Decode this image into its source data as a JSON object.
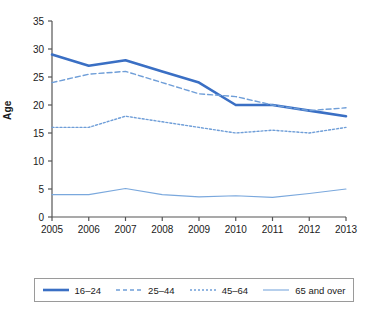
{
  "chart_data": {
    "type": "line",
    "title": "",
    "xlabel": "",
    "ylabel": "Age",
    "x": [
      2005,
      2006,
      2007,
      2008,
      2009,
      2010,
      2011,
      2012,
      2013
    ],
    "categories": [
      "2005",
      "2006",
      "2007",
      "2008",
      "2009",
      "2010",
      "2011",
      "2012",
      "2013"
    ],
    "ylim": [
      0,
      35
    ],
    "yticks": [
      0,
      5,
      10,
      15,
      20,
      25,
      30,
      35
    ],
    "ytick_labels": [
      "0",
      "5",
      "10",
      "15",
      "20",
      "25",
      "30",
      "35"
    ],
    "grid": false,
    "legend_position": "bottom",
    "series": [
      {
        "name": "16–24",
        "style": "solid-thick",
        "color": "#3a6fc4",
        "values": [
          29.0,
          27.0,
          28.0,
          26.0,
          24.0,
          20.0,
          20.0,
          19.0,
          18.0
        ]
      },
      {
        "name": "25–44",
        "style": "dashed",
        "color": "#6f9ed8",
        "values": [
          24.0,
          25.5,
          26.0,
          24.0,
          22.0,
          21.5,
          20.0,
          19.0,
          19.5
        ]
      },
      {
        "name": "45–64",
        "style": "dotted",
        "color": "#6f9ed8",
        "values": [
          16.0,
          16.0,
          18.0,
          17.0,
          16.0,
          15.0,
          15.5,
          15.0,
          16.0
        ]
      },
      {
        "name": "65 and over",
        "style": "solid-thin",
        "color": "#7aa8dd",
        "values": [
          4.0,
          4.0,
          5.1,
          4.0,
          3.6,
          3.8,
          3.5,
          4.2,
          5.0
        ]
      }
    ]
  },
  "axes": {
    "y_title": "Age",
    "y_ticks": [
      "35",
      "30",
      "25",
      "20",
      "15",
      "10",
      "5",
      "0"
    ],
    "x_ticks": [
      "2005",
      "2006",
      "2007",
      "2008",
      "2009",
      "2010",
      "2011",
      "2012",
      "2013"
    ]
  },
  "legend": {
    "items": [
      {
        "label": "16–24",
        "style": "solid-thick",
        "color": "#3a6fc4"
      },
      {
        "label": "25–44",
        "style": "dashed",
        "color": "#6f9ed8"
      },
      {
        "label": "45–64",
        "style": "dotted",
        "color": "#6f9ed8"
      },
      {
        "label": "65 and over",
        "style": "solid-thin",
        "color": "#7aa8dd"
      }
    ]
  },
  "colors": {
    "primary_line": "#3a6fc4",
    "secondary_line": "#6f9ed8",
    "axis": "#555555",
    "text": "#1a1a1a",
    "legend_border": "#9a9a9a"
  }
}
